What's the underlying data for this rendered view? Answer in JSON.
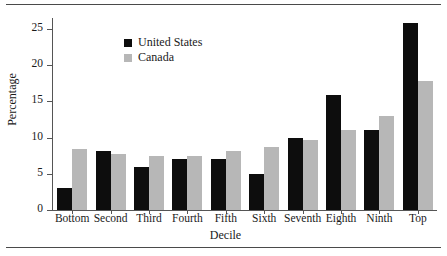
{
  "figure": {
    "has_top_rule": true,
    "has_bottom_rule": true,
    "background": "#ffffff"
  },
  "colors": {
    "united_states": "#0d0d0d",
    "canada": "#b7b7b7",
    "axis": "#555555",
    "text": "#1a1a1a"
  },
  "axis": {
    "y_title": "Percentage",
    "x_title": "Decile",
    "y_ticks": [
      "0",
      "5",
      "10",
      "15",
      "20",
      "25"
    ]
  },
  "legend": {
    "items": [
      {
        "label": "United States",
        "color": "#0d0d0d",
        "key": "us"
      },
      {
        "label": "Canada",
        "color": "#b7b7b7",
        "key": "canada"
      }
    ]
  },
  "chart_data": {
    "type": "bar",
    "title": "",
    "xlabel": "Decile",
    "ylabel": "Percentage",
    "ylim": [
      0,
      26.5
    ],
    "yticks": [
      0,
      5,
      10,
      15,
      20,
      25
    ],
    "grid": false,
    "legend_position": "top-left inside",
    "categories": [
      "Bottom",
      "Second",
      "Third",
      "Fourth",
      "Fifth",
      "Sixth",
      "Seventh",
      "Eighth",
      "Ninth",
      "Top"
    ],
    "series": [
      {
        "name": "United States",
        "color": "#0d0d0d",
        "values": [
          3.0,
          8.1,
          6.0,
          7.0,
          7.0,
          5.0,
          10.0,
          15.9,
          11.0,
          25.8
        ]
      },
      {
        "name": "Canada",
        "color": "#b7b7b7",
        "values": [
          8.4,
          7.8,
          7.5,
          7.4,
          8.2,
          8.7,
          9.6,
          11.1,
          13.0,
          17.8
        ]
      }
    ]
  }
}
